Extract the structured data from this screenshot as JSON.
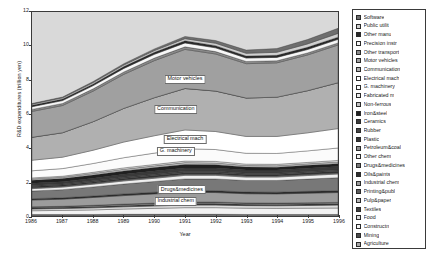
{
  "chart_data": {
    "type": "area",
    "stacked": true,
    "title": "",
    "xlabel": "Year",
    "ylabel": "R&D expenditures (trillion yen)",
    "x": [
      1986,
      1987,
      1988,
      1989,
      1990,
      1991,
      1992,
      1993,
      1994,
      1995,
      1996
    ],
    "xtick_labels": [
      "1986",
      "1987",
      "1988",
      "1989",
      "1990",
      "1991",
      "1992",
      "1993",
      "1994",
      "1995",
      "1996"
    ],
    "ytick_labels": [
      "0",
      "2",
      "4",
      "6",
      "8",
      "10",
      "12"
    ],
    "yticks": [
      0,
      2,
      4,
      6,
      8,
      10,
      12
    ],
    "ylim": [
      0,
      12
    ],
    "xlim": [
      1986,
      1996
    ],
    "grid": false,
    "legend_position": "right",
    "plot_background": "#d9d9d9",
    "frame_color": "#3a3a3a",
    "totals": [
      6.12,
      6.45,
      7.3,
      8.28,
      9.08,
      9.66,
      9.34,
      8.88,
      8.95,
      9.42,
      10.02
    ],
    "series": [
      {
        "name": "Agriculture",
        "fill": "#a8a8a8",
        "values": [
          0.05,
          0.05,
          0.05,
          0.06,
          0.06,
          0.06,
          0.06,
          0.06,
          0.06,
          0.06,
          0.06
        ]
      },
      {
        "name": "Mining",
        "fill": "#4a4a4a",
        "values": [
          0.04,
          0.04,
          0.04,
          0.04,
          0.04,
          0.04,
          0.04,
          0.03,
          0.03,
          0.03,
          0.03
        ]
      },
      {
        "name": "Constructn",
        "fill": "#f2f2f2",
        "values": [
          0.22,
          0.24,
          0.27,
          0.31,
          0.35,
          0.39,
          0.39,
          0.37,
          0.36,
          0.37,
          0.38
        ]
      },
      {
        "name": "Food",
        "fill": "#dcdcdc",
        "values": [
          0.1,
          0.11,
          0.12,
          0.13,
          0.14,
          0.15,
          0.15,
          0.15,
          0.15,
          0.16,
          0.17
        ]
      },
      {
        "name": "Textiles",
        "fill": "#3d3d3d",
        "values": [
          0.07,
          0.07,
          0.08,
          0.08,
          0.09,
          0.09,
          0.09,
          0.08,
          0.08,
          0.08,
          0.08
        ]
      },
      {
        "name": "Pulp&paper",
        "fill": "#b4b4b4",
        "values": [
          0.04,
          0.04,
          0.05,
          0.05,
          0.05,
          0.06,
          0.06,
          0.05,
          0.05,
          0.05,
          0.05
        ]
      },
      {
        "name": "Printing&publ",
        "fill": "#5a5a5a",
        "values": [
          0.02,
          0.02,
          0.02,
          0.03,
          0.03,
          0.03,
          0.03,
          0.03,
          0.03,
          0.03,
          0.03
        ]
      },
      {
        "name": "Industrial chem",
        "fill": "#9c9c9c",
        "values": [
          0.4,
          0.42,
          0.46,
          0.5,
          0.54,
          0.57,
          0.56,
          0.54,
          0.54,
          0.56,
          0.58
        ]
      },
      {
        "name": "Oils&paints",
        "fill": "#2e2e2e",
        "values": [
          0.08,
          0.08,
          0.09,
          0.1,
          0.1,
          0.11,
          0.11,
          0.1,
          0.1,
          0.11,
          0.11
        ]
      },
      {
        "name": "Drugs&medicines",
        "fill": "#787878",
        "values": [
          0.45,
          0.48,
          0.53,
          0.58,
          0.63,
          0.68,
          0.69,
          0.68,
          0.69,
          0.72,
          0.76
        ]
      },
      {
        "name": "Other chem",
        "fill": "#efefef",
        "values": [
          0.14,
          0.15,
          0.16,
          0.18,
          0.19,
          0.21,
          0.21,
          0.2,
          0.2,
          0.21,
          0.22
        ]
      },
      {
        "name": "Petroleum&coal",
        "fill": "#8e8e8e",
        "values": [
          0.05,
          0.05,
          0.05,
          0.06,
          0.06,
          0.06,
          0.06,
          0.06,
          0.06,
          0.06,
          0.06
        ]
      },
      {
        "name": "Plastic",
        "fill": "#353535",
        "values": [
          0.07,
          0.07,
          0.08,
          0.09,
          0.1,
          0.1,
          0.1,
          0.09,
          0.09,
          0.1,
          0.1
        ]
      },
      {
        "name": "Rubber",
        "fill": "#444444",
        "values": [
          0.06,
          0.06,
          0.07,
          0.07,
          0.08,
          0.08,
          0.08,
          0.08,
          0.08,
          0.08,
          0.08
        ]
      },
      {
        "name": "Ceramics",
        "fill": "#3a3a3a",
        "values": [
          0.13,
          0.14,
          0.15,
          0.17,
          0.18,
          0.19,
          0.19,
          0.18,
          0.18,
          0.19,
          0.2
        ]
      },
      {
        "name": "Iron&steel",
        "fill": "#202020",
        "values": [
          0.18,
          0.18,
          0.19,
          0.2,
          0.21,
          0.21,
          0.2,
          0.18,
          0.17,
          0.17,
          0.17
        ]
      },
      {
        "name": "Non-ferrous",
        "fill": "#c2c2c2",
        "values": [
          0.08,
          0.08,
          0.09,
          0.1,
          0.1,
          0.11,
          0.1,
          0.09,
          0.09,
          0.09,
          0.1
        ]
      },
      {
        "name": "Fabricated m",
        "fill": "#ededed",
        "values": [
          0.06,
          0.06,
          0.07,
          0.08,
          0.08,
          0.09,
          0.09,
          0.08,
          0.08,
          0.08,
          0.09
        ]
      },
      {
        "name": "G. machinery",
        "fill": "#fbfbfb",
        "values": [
          0.42,
          0.45,
          0.52,
          0.6,
          0.67,
          0.73,
          0.7,
          0.64,
          0.64,
          0.68,
          0.73
        ]
      },
      {
        "name": "Electrical mach",
        "fill": "#ffffff",
        "values": [
          0.62,
          0.67,
          0.78,
          0.92,
          1.02,
          1.1,
          1.06,
          0.99,
          1.0,
          1.06,
          1.14
        ]
      },
      {
        "name": "Communication",
        "fill": "#b0b0b0",
        "values": [
          1.35,
          1.44,
          1.68,
          1.98,
          2.24,
          2.44,
          2.38,
          2.26,
          2.31,
          2.48,
          2.7
        ]
      },
      {
        "name": "Electrical mach ",
        "fill": "#c8c8c8",
        "values": [
          0.0,
          0.0,
          0.0,
          0.0,
          0.0,
          0.0,
          0.0,
          0.0,
          0.0,
          0.0,
          0.0
        ]
      },
      {
        "name": "Motor vehicles",
        "fill": "#a0a0a0",
        "values": [
          1.52,
          1.6,
          1.8,
          2.0,
          2.18,
          2.3,
          2.18,
          2.02,
          2.02,
          2.1,
          2.22
        ]
      },
      {
        "name": "Other transport",
        "fill": "#8a8a8a",
        "values": [
          0.12,
          0.12,
          0.13,
          0.14,
          0.15,
          0.15,
          0.14,
          0.13,
          0.12,
          0.12,
          0.12
        ]
      },
      {
        "name": "Precision instr",
        "fill": "#f7f7f7",
        "values": [
          0.16,
          0.17,
          0.19,
          0.21,
          0.22,
          0.23,
          0.22,
          0.2,
          0.2,
          0.2,
          0.21
        ]
      },
      {
        "name": "Other manu",
        "fill": "#2a2a2a",
        "values": [
          0.09,
          0.09,
          0.1,
          0.11,
          0.12,
          0.13,
          0.13,
          0.12,
          0.12,
          0.13,
          0.13
        ]
      },
      {
        "name": "Public utilit",
        "fill": "#d0d0d0",
        "values": [
          0.06,
          0.07,
          0.08,
          0.09,
          0.1,
          0.12,
          0.14,
          0.16,
          0.18,
          0.2,
          0.22
        ]
      },
      {
        "name": "Software",
        "fill": "#6e6e6e",
        "values": [
          0.04,
          0.05,
          0.06,
          0.08,
          0.1,
          0.13,
          0.16,
          0.19,
          0.22,
          0.26,
          0.3
        ]
      }
    ]
  },
  "legend": {
    "items": [
      {
        "label": "Software",
        "fill": "#6e6e6e"
      },
      {
        "label": "Public utilit",
        "fill": "#d0d0d0"
      },
      {
        "label": "Other manu",
        "fill": "#2a2a2a"
      },
      {
        "label": "Precision instr",
        "fill": "#f7f7f7"
      },
      {
        "label": "Other transport",
        "fill": "#8a8a8a"
      },
      {
        "label": "Motor vehicles",
        "fill": "#a0a0a0"
      },
      {
        "label": "Communication",
        "fill": "#b0b0b0"
      },
      {
        "label": "Electrical mach",
        "fill": "#ffffff"
      },
      {
        "label": "G. machinery",
        "fill": "#fbfbfb"
      },
      {
        "label": "Fabricated m",
        "fill": "#ededed"
      },
      {
        "label": "Non-ferrous",
        "fill": "#c2c2c2"
      },
      {
        "label": "Iron&steel",
        "fill": "#202020"
      },
      {
        "label": "Ceramics",
        "fill": "#3a3a3a"
      },
      {
        "label": "Rubber",
        "fill": "#444444"
      },
      {
        "label": "Plastic",
        "fill": "#353535"
      },
      {
        "label": "Petroleum&coal",
        "fill": "#8e8e8e"
      },
      {
        "label": "Other chem",
        "fill": "#efefef"
      },
      {
        "label": "Drugs&medicines",
        "fill": "#787878"
      },
      {
        "label": "Oils&paints",
        "fill": "#2e2e2e"
      },
      {
        "label": "Industrial chem",
        "fill": "#9c9c9c"
      },
      {
        "label": "Printing&publ",
        "fill": "#5a5a5a"
      },
      {
        "label": "Pulp&paper",
        "fill": "#b4b4b4"
      },
      {
        "label": "Textiles",
        "fill": "#3d3d3d"
      },
      {
        "label": "Food",
        "fill": "#dcdcdc"
      },
      {
        "label": "Constructn",
        "fill": "#f2f2f2"
      },
      {
        "label": "Mining",
        "fill": "#4a4a4a"
      },
      {
        "label": "Agriculture",
        "fill": "#a8a8a8"
      }
    ]
  },
  "annotations": [
    {
      "text": "Motor vehicles",
      "x": 0.5,
      "y": 8.05
    },
    {
      "text": "Communication",
      "x": 0.47,
      "y": 6.3
    },
    {
      "text": "Electrical mach",
      "x": 0.5,
      "y": 4.55
    },
    {
      "text": "G. machinery",
      "x": 0.47,
      "y": 3.85
    },
    {
      "text": "Drugs&medicines",
      "x": 0.49,
      "y": 1.62
    },
    {
      "text": "Industrial chem",
      "x": 0.47,
      "y": 0.95
    }
  ]
}
